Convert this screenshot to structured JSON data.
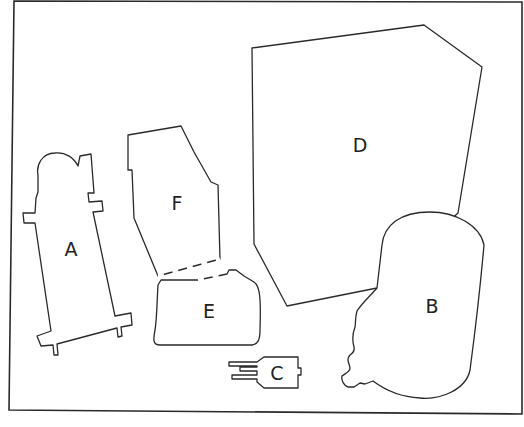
{
  "diagram": {
    "type": "labeled-shapes-puzzle",
    "border_color": "#2a2a2a",
    "background": "#ffffff",
    "pieces": [
      {
        "id": "A",
        "label": "A",
        "description": "tall tower shape with rounded top and tabs"
      },
      {
        "id": "B",
        "label": "B",
        "description": "rounded blob with jagged left edge"
      },
      {
        "id": "C",
        "label": "C",
        "description": "small connector with three prongs on left"
      },
      {
        "id": "D",
        "label": "D",
        "description": "large irregular polygon"
      },
      {
        "id": "E",
        "label": "E",
        "description": "rounded rectangle with notch on top right"
      },
      {
        "id": "F",
        "label": "F",
        "description": "slanted polygon"
      }
    ]
  }
}
